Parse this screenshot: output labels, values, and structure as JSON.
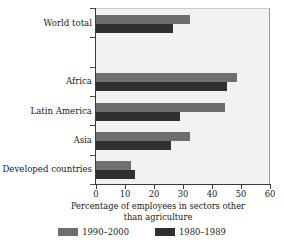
{
  "chart_data": {
    "type": "bar",
    "orientation": "horizontal",
    "title": "",
    "xlabel": "Percentage of employees in sectors other than agriculture",
    "ylabel": "",
    "xlim": [
      0,
      60
    ],
    "xticks": [
      0,
      10,
      20,
      30,
      40,
      50,
      60
    ],
    "grid": false,
    "legend_position": "bottom",
    "categories": [
      "World total",
      "",
      "Africa",
      "Latin America",
      "Asia",
      "Developed countries"
    ],
    "series": [
      {
        "name": "1990–2000",
        "color": "#6e6e6e",
        "values": [
          32.5,
          null,
          48.5,
          44.5,
          32.5,
          12.0
        ]
      },
      {
        "name": "1980–1989",
        "color": "#303030",
        "values": [
          26.5,
          null,
          45.0,
          29.0,
          26.0,
          13.5
        ]
      }
    ]
  },
  "axis": {
    "x_title_line1": "Percentage of employees in sectors other",
    "x_title_line2": "than agriculture",
    "tick_labels": [
      "0",
      "10",
      "20",
      "30",
      "40",
      "50",
      "60"
    ]
  },
  "categories": [
    {
      "label": "World total"
    },
    {
      "label": ""
    },
    {
      "label": "Africa"
    },
    {
      "label": "Latin America"
    },
    {
      "label": "Asia"
    },
    {
      "label": "Developed countries"
    }
  ],
  "legend": {
    "items": [
      {
        "label": "1990–2000",
        "color": "#6e6e6e"
      },
      {
        "label": "1980–1989",
        "color": "#303030"
      }
    ]
  },
  "colors": {
    "series_recent": "#6e6e6e",
    "series_older": "#303030",
    "plot_background": "#f2f2f2",
    "axis": "#3a3a3a",
    "text": "#1a1a1a"
  }
}
